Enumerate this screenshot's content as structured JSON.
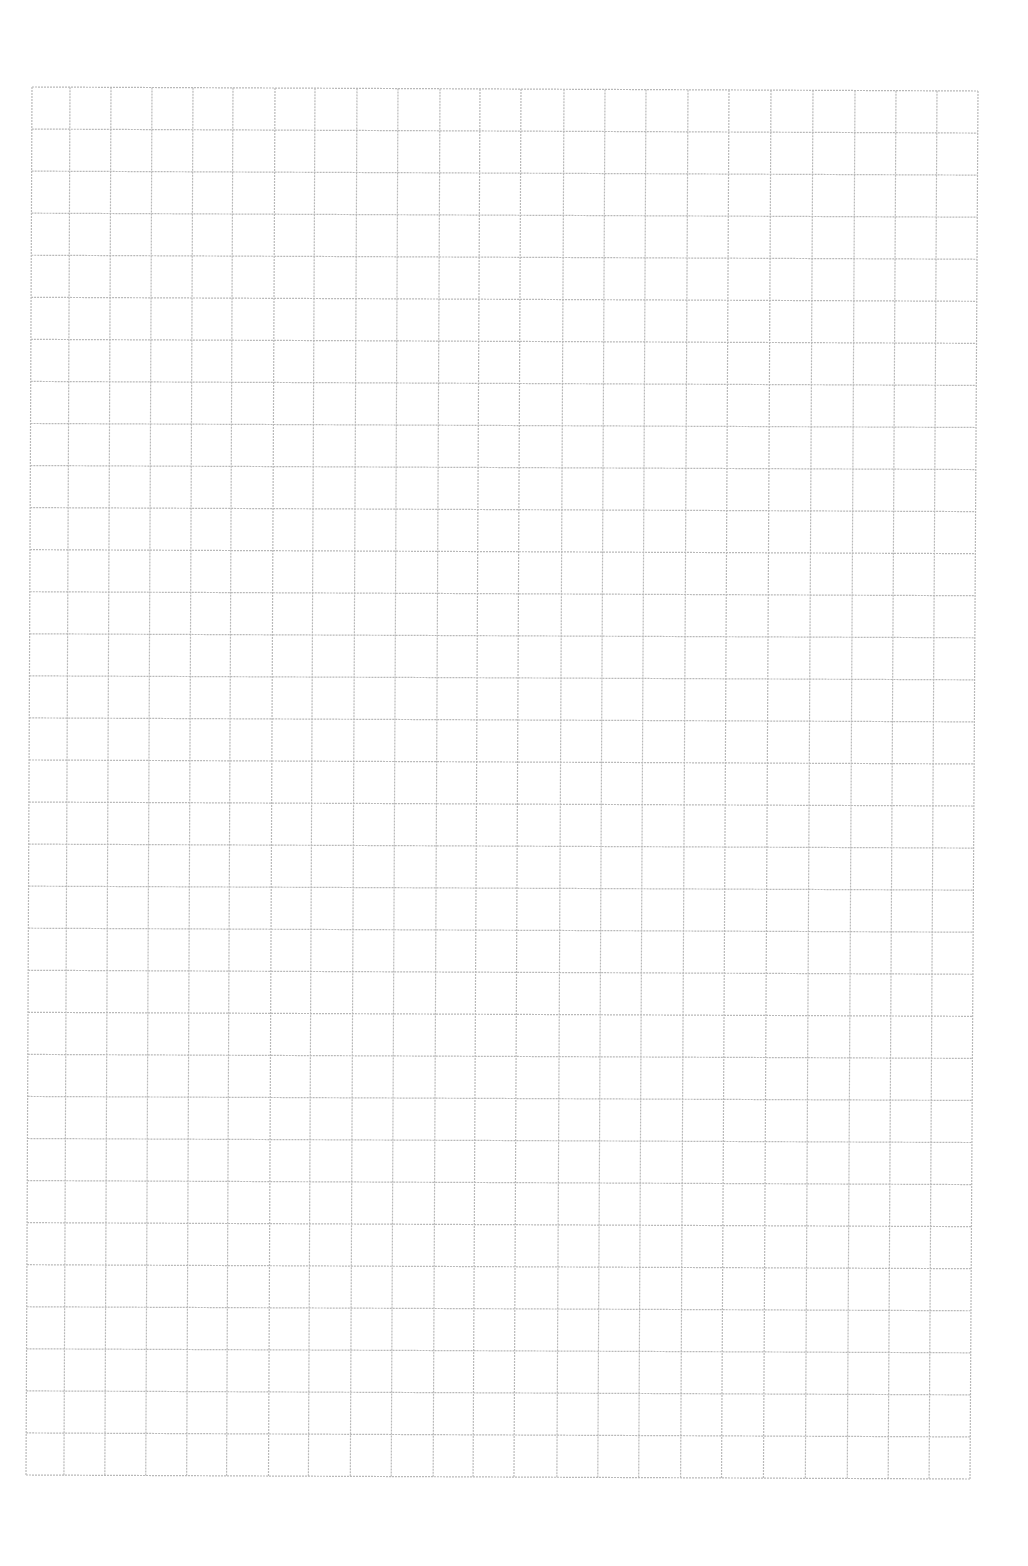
{
  "page": {
    "type": "graph-paper",
    "background_color": "#ffffff",
    "line_color": "#b9b9b9"
  },
  "grid": {
    "columns": 23,
    "rows": 33,
    "corners": {
      "top_left": [
        32,
        87
      ],
      "top_right": [
        978,
        91
      ],
      "bottom_left": [
        26,
        1475
      ],
      "bottom_right": [
        970,
        1479
      ]
    },
    "column_lines_top_x": [
      32,
      70,
      111,
      152,
      193,
      233,
      275,
      315,
      357,
      398,
      440,
      480,
      521,
      564,
      605,
      646,
      688,
      729,
      771,
      813,
      855,
      896,
      937,
      978
    ]
  }
}
